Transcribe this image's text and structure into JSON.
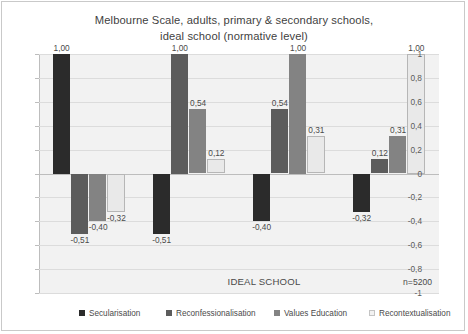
{
  "chart_data": {
    "type": "bar",
    "title": "Melbourne Scale, adults, primary & secondary schools, ideal school (normative level)",
    "title_line1": "Melbourne Scale, adults, primary & secondary schools,",
    "title_line2": "ideal school (normative level)",
    "xlabel": "IDEAL SCHOOL",
    "ylabel": "",
    "ylim": [
      -1,
      1
    ],
    "ytick_labels": [
      "1",
      "0,8",
      "0,6",
      "0,4",
      "0,2",
      "0",
      "-0,2",
      "-0,4",
      "-0,6",
      "-0,8",
      "-1"
    ],
    "ytick_values": [
      1,
      0.8,
      0.6,
      0.4,
      0.2,
      0,
      -0.2,
      -0.4,
      -0.6,
      -0.8,
      -1
    ],
    "grid": true,
    "legend_position": "bottom",
    "annotation": "n=5200",
    "categories": [
      "Secularisation",
      "Reconfessionalisation",
      "Values Education",
      "Recontextualisation"
    ],
    "series": [
      {
        "name": "Secularisation",
        "color": "#2b2b2b",
        "values": [
          1.0,
          -0.51,
          -0.4,
          -0.32
        ],
        "labels": [
          "1,00",
          "-0,51",
          "-0,40",
          "-0,32"
        ]
      },
      {
        "name": "Reconfessionalisation",
        "color": "#5c5c5c",
        "values": [
          -0.51,
          1.0,
          0.54,
          0.12
        ],
        "labels": [
          "-0,51",
          "1,00",
          "0,54",
          "0,12"
        ]
      },
      {
        "name": "Values Education",
        "color": "#838383",
        "values": [
          -0.4,
          0.54,
          1.0,
          0.31
        ],
        "labels": [
          "-0,40",
          "0,54",
          "1,00",
          "0,31"
        ]
      },
      {
        "name": "Recontextualisation",
        "color": "#e9e9e9",
        "values": [
          -0.32,
          0.12,
          0.31,
          1.0
        ],
        "labels": [
          "-0,32",
          "0,12",
          "0,31",
          "1,00"
        ]
      }
    ]
  },
  "legend": {
    "items": [
      {
        "label": "Secularisation"
      },
      {
        "label": "Reconfessionalisation"
      },
      {
        "label": "Values Education"
      },
      {
        "label": "Recontextualisation"
      }
    ]
  }
}
